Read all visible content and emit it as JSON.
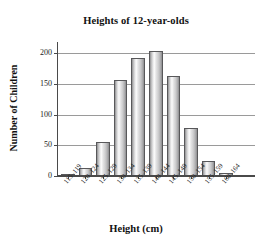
{
  "chart_data": {
    "type": "bar",
    "title": "Heights of 12-year-olds",
    "xlabel": "Height (cm)",
    "ylabel": "Number of Children",
    "categories": [
      "115–119",
      "120–124",
      "125–129",
      "130–134",
      "135–139",
      "140–144",
      "145–149",
      "150–154",
      "155–159",
      "160–164"
    ],
    "values": [
      3,
      13,
      55,
      157,
      192,
      203,
      163,
      79,
      24,
      5
    ],
    "ylim": [
      0,
      215
    ],
    "yticks": [
      0,
      50,
      100,
      150,
      200
    ],
    "ytick_labels": [
      "0",
      "50",
      "100",
      "150",
      "200"
    ],
    "grid": "horizontal",
    "legend": "none",
    "bar_face_color": "#d8d8d9",
    "bar_edge_color": "#58585a",
    "gridline_color": "#9a9a9a",
    "axis_color": "#4a4a4a",
    "background_color": "#ffffff"
  }
}
